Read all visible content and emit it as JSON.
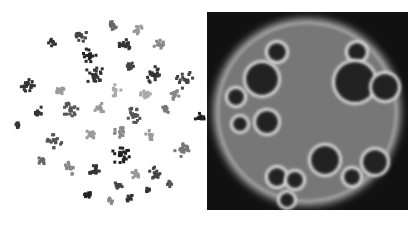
{
  "figure": {
    "left_panel": {
      "title": "",
      "type": "cluster-scatter",
      "background": "#ffffff"
    },
    "right_panel": {
      "title": "",
      "type": "density-map",
      "background": "#111111",
      "glow_color": "#bdbdbd"
    }
  },
  "clusters": [
    {
      "x": 80,
      "y": 35,
      "r": 7,
      "shade": "#444"
    },
    {
      "x": 112,
      "y": 25,
      "r": 5,
      "shade": "#666"
    },
    {
      "x": 138,
      "y": 30,
      "r": 5,
      "shade": "#999"
    },
    {
      "x": 52,
      "y": 42,
      "r": 4,
      "shade": "#333"
    },
    {
      "x": 90,
      "y": 55,
      "r": 8,
      "shade": "#222"
    },
    {
      "x": 125,
      "y": 45,
      "r": 6,
      "shade": "#333"
    },
    {
      "x": 160,
      "y": 45,
      "r": 6,
      "shade": "#888"
    },
    {
      "x": 130,
      "y": 65,
      "r": 5,
      "shade": "#444"
    },
    {
      "x": 95,
      "y": 75,
      "r": 10,
      "shade": "#333"
    },
    {
      "x": 155,
      "y": 75,
      "r": 9,
      "shade": "#333"
    },
    {
      "x": 185,
      "y": 80,
      "r": 9,
      "shade": "#444"
    },
    {
      "x": 28,
      "y": 85,
      "r": 8,
      "shade": "#333"
    },
    {
      "x": 60,
      "y": 90,
      "r": 5,
      "shade": "#999"
    },
    {
      "x": 115,
      "y": 90,
      "r": 6,
      "shade": "#aaa"
    },
    {
      "x": 145,
      "y": 95,
      "r": 6,
      "shade": "#aaa"
    },
    {
      "x": 175,
      "y": 95,
      "r": 5,
      "shade": "#888"
    },
    {
      "x": 38,
      "y": 112,
      "r": 6,
      "shade": "#333"
    },
    {
      "x": 70,
      "y": 110,
      "r": 8,
      "shade": "#555"
    },
    {
      "x": 100,
      "y": 108,
      "r": 6,
      "shade": "#999"
    },
    {
      "x": 135,
      "y": 115,
      "r": 8,
      "shade": "#555"
    },
    {
      "x": 165,
      "y": 110,
      "r": 5,
      "shade": "#777"
    },
    {
      "x": 200,
      "y": 118,
      "r": 5,
      "shade": "#222"
    },
    {
      "x": 18,
      "y": 125,
      "r": 4,
      "shade": "#333"
    },
    {
      "x": 55,
      "y": 140,
      "r": 8,
      "shade": "#555"
    },
    {
      "x": 90,
      "y": 135,
      "r": 5,
      "shade": "#999"
    },
    {
      "x": 120,
      "y": 132,
      "r": 6,
      "shade": "#888"
    },
    {
      "x": 150,
      "y": 135,
      "r": 5,
      "shade": "#999"
    },
    {
      "x": 120,
      "y": 155,
      "r": 10,
      "shade": "#222"
    },
    {
      "x": 182,
      "y": 150,
      "r": 8,
      "shade": "#777"
    },
    {
      "x": 42,
      "y": 160,
      "r": 5,
      "shade": "#666"
    },
    {
      "x": 70,
      "y": 168,
      "r": 7,
      "shade": "#888"
    },
    {
      "x": 95,
      "y": 172,
      "r": 7,
      "shade": "#333"
    },
    {
      "x": 135,
      "y": 175,
      "r": 5,
      "shade": "#999"
    },
    {
      "x": 155,
      "y": 173,
      "r": 6,
      "shade": "#444"
    },
    {
      "x": 118,
      "y": 185,
      "r": 5,
      "shade": "#444"
    },
    {
      "x": 85,
      "y": 195,
      "r": 6,
      "shade": "#222"
    },
    {
      "x": 110,
      "y": 200,
      "r": 4,
      "shade": "#888"
    },
    {
      "x": 130,
      "y": 198,
      "r": 4,
      "shade": "#333"
    },
    {
      "x": 148,
      "y": 190,
      "r": 4,
      "shade": "#333"
    },
    {
      "x": 170,
      "y": 183,
      "r": 4,
      "shade": "#555"
    }
  ],
  "density_holes": [
    {
      "x": 70,
      "y": 40,
      "r": 9
    },
    {
      "x": 150,
      "y": 40,
      "r": 9
    },
    {
      "x": 55,
      "y": 67,
      "r": 16
    },
    {
      "x": 148,
      "y": 70,
      "r": 20
    },
    {
      "x": 178,
      "y": 75,
      "r": 13
    },
    {
      "x": 29,
      "y": 85,
      "r": 8
    },
    {
      "x": 33,
      "y": 112,
      "r": 7
    },
    {
      "x": 60,
      "y": 110,
      "r": 11
    },
    {
      "x": 70,
      "y": 165,
      "r": 9
    },
    {
      "x": 118,
      "y": 148,
      "r": 14
    },
    {
      "x": 168,
      "y": 150,
      "r": 12
    },
    {
      "x": 88,
      "y": 168,
      "r": 8
    },
    {
      "x": 145,
      "y": 165,
      "r": 8
    },
    {
      "x": 80,
      "y": 188,
      "r": 7
    }
  ]
}
